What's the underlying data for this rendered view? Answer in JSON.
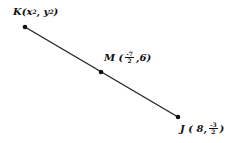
{
  "points": {
    "K": {
      "label": "K",
      "coords_text": [
        "x",
        "2",
        "y",
        "2"
      ]
    },
    "M": {
      "label": "M",
      "x_num": "-7",
      "x_den": "2",
      "y": "6"
    },
    "J": {
      "label": "J",
      "x": "8",
      "y_num": "-3",
      "y_den": "2"
    }
  }
}
